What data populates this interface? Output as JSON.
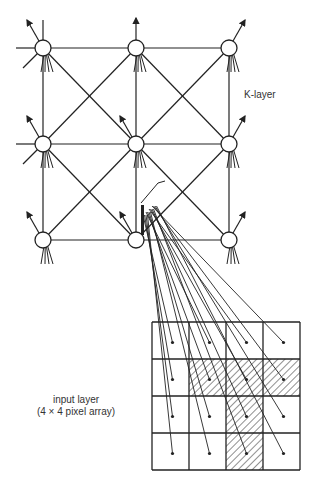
{
  "labels": {
    "k_layer": "K-layer",
    "input_layer_line1": "input layer",
    "input_layer_line2": "(4 × 4  pixel array)"
  },
  "k_layer": {
    "rows": 3,
    "cols": 3,
    "node_x": [
      43,
      136,
      229
    ],
    "node_y": [
      48,
      144,
      240
    ],
    "node_radius": 8,
    "connections": [
      "horizontal",
      "vertical",
      "diagonal"
    ],
    "highlighted_node": [
      2,
      1
    ]
  },
  "input_layer": {
    "rows": 4,
    "cols": 4,
    "x0": 152,
    "y0": 322,
    "cell": 37,
    "hatched_cells": [
      [
        1,
        1
      ],
      [
        1,
        2
      ],
      [
        1,
        3
      ],
      [
        2,
        2
      ],
      [
        3,
        2
      ]
    ]
  },
  "colors": {
    "line": "#222222",
    "background": "#ffffff"
  }
}
